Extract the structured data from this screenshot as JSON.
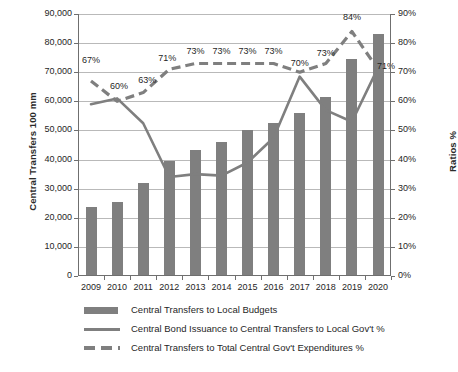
{
  "chart_data": {
    "type": "bar",
    "title": "",
    "subtitle": "",
    "xlabel": "",
    "ylabel": "Central Transfers 100 mm",
    "y2label": "Ratios %",
    "grid": true,
    "legend_position": "bottom",
    "categories": [
      "2009",
      "2010",
      "2011",
      "2012",
      "2013",
      "2014",
      "2015",
      "2016",
      "2017",
      "2018",
      "2019",
      "2020"
    ],
    "ylim": [
      0,
      90000
    ],
    "y2lim": [
      0,
      90
    ],
    "y_ticks": [
      "0",
      "10,000",
      "20,000",
      "30,000",
      "40,000",
      "50,000",
      "60,000",
      "70,000",
      "80,000",
      "90,000"
    ],
    "y2_ticks": [
      "0%",
      "10%",
      "20%",
      "30%",
      "40%",
      "50%",
      "60%",
      "70%",
      "80%",
      "90%"
    ],
    "series": [
      {
        "name": "Central Transfers to Local Budgets",
        "type": "bar",
        "axis": "left",
        "color": "#7f7f7f",
        "values": [
          23800,
          25300,
          32000,
          39500,
          43300,
          46200,
          50300,
          52500,
          56000,
          61500,
          74700,
          83000
        ]
      },
      {
        "name": "Central Bond Issuance to Central Transfers to Local Gov't  %",
        "type": "line",
        "style": "solid",
        "axis": "right",
        "color": "#7f7f7f",
        "values": [
          59,
          61,
          52.5,
          34,
          35,
          34.5,
          39,
          47.5,
          68.5,
          57,
          53,
          71.5
        ]
      },
      {
        "name": "Central Transfers to Total Central Gov't Expenditures %",
        "type": "line",
        "style": "dashed",
        "axis": "right",
        "color": "#7f7f7f",
        "values": [
          67,
          60,
          63,
          71,
          73,
          73,
          73,
          73,
          70,
          73,
          84,
          71
        ],
        "data_labels": [
          "67%",
          "60%",
          "63%",
          "71%",
          "73%",
          "73%",
          "73%",
          "73%",
          "70%",
          "73%",
          "84%",
          "71%"
        ]
      }
    ]
  },
  "legend": {
    "items": [
      {
        "label": "Central Transfers to Local Budgets",
        "key": "bar-swatch"
      },
      {
        "label": "Central Bond Issuance to Central Transfers to Local Gov't  %",
        "key": "solid-line-swatch"
      },
      {
        "label": "Central Transfers to Total Central Gov't Expenditures %",
        "key": "dashed-line-swatch"
      }
    ]
  },
  "colors": {
    "series_gray": "#7f7f7f",
    "grid": "#b9b9b9",
    "axis": "#6f6f6f",
    "text": "#1f1f1f",
    "background": "#ffffff"
  }
}
